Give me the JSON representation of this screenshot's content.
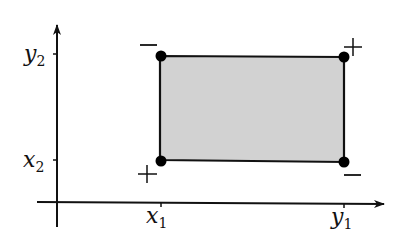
{
  "diagram": {
    "type": "rectangle-on-axes",
    "colors": {
      "axis": "#111111",
      "rect_fill": "#d2d2d2",
      "rect_stroke": "#111111",
      "vertex": "#000000"
    },
    "axes": {
      "y_ticks": [
        {
          "base": "y",
          "sub": "2"
        },
        {
          "base": "x",
          "sub": "2"
        }
      ],
      "x_ticks": [
        {
          "base": "x",
          "sub": "1"
        },
        {
          "base": "y",
          "sub": "1"
        }
      ]
    },
    "corner_signs": {
      "top_left": "−",
      "top_right": "+",
      "bottom_left": "+",
      "bottom_right": "−"
    }
  }
}
